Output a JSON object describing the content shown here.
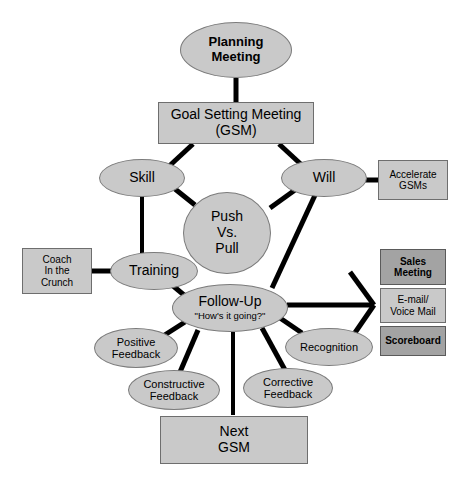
{
  "diagram": {
    "colors": {
      "node_fill_light": "#c9c9c9",
      "node_fill_dark": "#a3a3a3",
      "node_stroke": "#7b7b7b",
      "edge": "#000000",
      "background": "#ffffff",
      "text": "#000000"
    },
    "nodes": {
      "planning_meeting": {
        "label": "Planning\nMeeting",
        "shape": "ellipse",
        "emphasis": "bold"
      },
      "goal_setting_meeting": {
        "label": "Goal Setting Meeting\n(GSM)",
        "shape": "rectangle",
        "emphasis": "normal"
      },
      "skill": {
        "label": "Skill",
        "shape": "ellipse",
        "emphasis": "normal"
      },
      "will": {
        "label": "Will",
        "shape": "ellipse",
        "emphasis": "normal"
      },
      "push_vs_pull": {
        "label": "Push\nVs.\nPull",
        "shape": "circle",
        "emphasis": "normal"
      },
      "accelerate_gsms": {
        "label": "Accelerate\nGSMs",
        "shape": "rectangle",
        "emphasis": "normal"
      },
      "training": {
        "label": "Training",
        "shape": "ellipse",
        "emphasis": "normal"
      },
      "coach_in_the_crunch": {
        "label": "Coach\nIn the\nCrunch",
        "shape": "rectangle",
        "emphasis": "normal"
      },
      "follow_up": {
        "label": "Follow-Up",
        "sublabel": "\"How's it going?\"",
        "shape": "ellipse",
        "emphasis": "normal"
      },
      "positive_feedback": {
        "label": "Positive\nFeedback",
        "shape": "ellipse",
        "emphasis": "normal"
      },
      "constructive_feedback": {
        "label": "Constructive\nFeedback",
        "shape": "ellipse",
        "emphasis": "normal"
      },
      "corrective_feedback": {
        "label": "Corrective\nFeedback",
        "shape": "ellipse",
        "emphasis": "normal"
      },
      "recognition": {
        "label": "Recognition",
        "shape": "ellipse",
        "emphasis": "normal"
      },
      "sales_meeting": {
        "label": "Sales\nMeeting",
        "shape": "rectangle",
        "emphasis": "bold"
      },
      "email_voice_mail": {
        "label": "E-mail/\nVoice Mail",
        "shape": "rectangle",
        "emphasis": "normal"
      },
      "scoreboard": {
        "label": "Scoreboard",
        "shape": "rectangle",
        "emphasis": "bold"
      },
      "next_gsm": {
        "label": "Next\nGSM",
        "shape": "rectangle",
        "emphasis": "normal"
      }
    },
    "edges": [
      {
        "from": "planning_meeting",
        "to": "goal_setting_meeting"
      },
      {
        "from": "goal_setting_meeting",
        "to": "skill"
      },
      {
        "from": "goal_setting_meeting",
        "to": "will"
      },
      {
        "from": "skill",
        "to": "push_vs_pull"
      },
      {
        "from": "will",
        "to": "push_vs_pull"
      },
      {
        "from": "will",
        "to": "accelerate_gsms"
      },
      {
        "from": "skill",
        "to": "training"
      },
      {
        "from": "training",
        "to": "coach_in_the_crunch"
      },
      {
        "from": "training",
        "to": "follow_up"
      },
      {
        "from": "will",
        "to": "follow_up"
      },
      {
        "from": "follow_up",
        "to": "positive_feedback"
      },
      {
        "from": "follow_up",
        "to": "constructive_feedback"
      },
      {
        "from": "follow_up",
        "to": "corrective_feedback"
      },
      {
        "from": "follow_up",
        "to": "recognition"
      },
      {
        "from": "follow_up",
        "to": "sales_meeting"
      },
      {
        "from": "follow_up",
        "to": "email_voice_mail"
      },
      {
        "from": "follow_up",
        "to": "scoreboard"
      },
      {
        "from": "follow_up",
        "to": "next_gsm"
      }
    ]
  }
}
